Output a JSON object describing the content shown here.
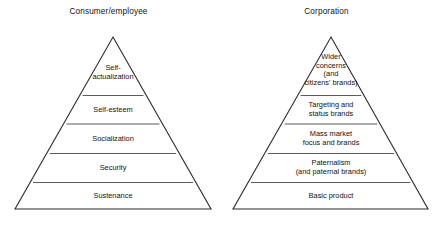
{
  "figure": {
    "type": "two-pyramid-comparison-diagram",
    "background_color": "#ffffff",
    "line_color": "#2b2b2b",
    "text_color": "#111111"
  },
  "panels": [
    {
      "id": "consumer-employee",
      "title": "Consumer/employee",
      "tiers": [
        {
          "id": "self-actualization",
          "label": "Self-\nactualization"
        },
        {
          "id": "self-esteem",
          "label": "Self-esteem"
        },
        {
          "id": "socialization",
          "label": "Socialization"
        },
        {
          "id": "security",
          "label": "Security"
        },
        {
          "id": "sustenance",
          "label": "Sustenance"
        }
      ]
    },
    {
      "id": "corporation",
      "title": "Corporation",
      "tiers": [
        {
          "id": "wider-concerns",
          "label": "Wider\nconcerns\n(and\ncitizens' brands)"
        },
        {
          "id": "targeting-status",
          "label": "Targeting and\nstatus brands"
        },
        {
          "id": "mass-market",
          "label": "Mass market\nfocus and brands"
        },
        {
          "id": "paternalism",
          "label": "Paternalism\n(and paternal brands)"
        },
        {
          "id": "basic-product",
          "label": "Basic product"
        }
      ]
    }
  ]
}
